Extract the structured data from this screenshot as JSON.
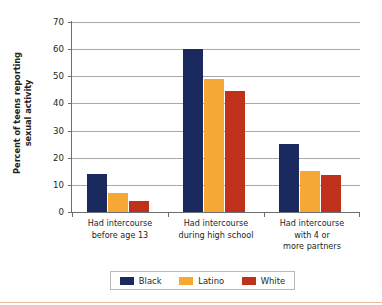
{
  "chart_data": {
    "type": "bar",
    "title": "",
    "xlabel": "",
    "ylabel_line1": "Percent of teens reporting",
    "ylabel_line2": "sexual activity",
    "ylim": [
      0,
      70
    ],
    "yticks": [
      0,
      10,
      20,
      30,
      40,
      50,
      60,
      70
    ],
    "ytick_labels": [
      "0",
      "10",
      "20",
      "30",
      "40",
      "50",
      "60",
      "70"
    ],
    "grid": true,
    "legend_position": "bottom-center",
    "categories": [
      "Had intercourse before age 13",
      "Had intercourse during high school",
      "Had intercourse with 4 or more partners"
    ],
    "category_label_lines": [
      [
        "Had intercourse",
        "before age 13"
      ],
      [
        "Had intercourse",
        "during high school"
      ],
      [
        "Had intercourse",
        "with 4 or",
        "more partners"
      ]
    ],
    "series": [
      {
        "name": "Black",
        "color": "#1a2a5e",
        "values": [
          14,
          60,
          25
        ]
      },
      {
        "name": "Latino",
        "color": "#f5a833",
        "values": [
          7,
          49,
          15
        ]
      },
      {
        "name": "White",
        "color": "#c0311c",
        "values": [
          4,
          44.5,
          13.5
        ]
      }
    ]
  },
  "legend": {
    "items": [
      {
        "label": "Black",
        "color": "#1a2a5e"
      },
      {
        "label": "Latino",
        "color": "#f5a833"
      },
      {
        "label": "White",
        "color": "#c0311c"
      }
    ]
  },
  "colors": {
    "black_series": "#1a2a5e",
    "latino_series": "#f5a833",
    "white_series": "#c0311c",
    "gridline": "#a7a9ac",
    "axis": "#6d6e71",
    "text": "#231f20",
    "bottom_rule": "#e8b48f"
  }
}
